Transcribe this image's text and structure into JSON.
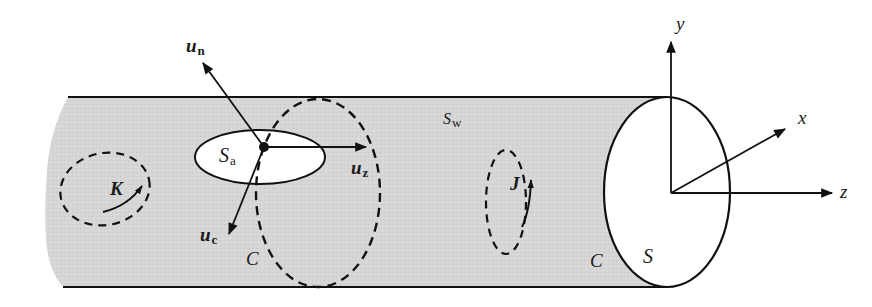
{
  "figure": {
    "colors": {
      "wall_fill": "#d4d4d4",
      "line": "#111111",
      "aperture_fill": "#ffffff"
    },
    "labels": {
      "un_main": "u",
      "un_sub": "n",
      "uz_main": "u",
      "uz_sub": "z",
      "uc_main": "u",
      "uc_sub": "c",
      "sa_main": "S",
      "sa_sub": "a",
      "sw_main": "S",
      "sw_sub": "w",
      "k": "K",
      "j": "J",
      "c_left": "C",
      "c_right": "C",
      "s": "S",
      "axis_x": "x",
      "axis_y": "y",
      "axis_z": "z"
    }
  }
}
